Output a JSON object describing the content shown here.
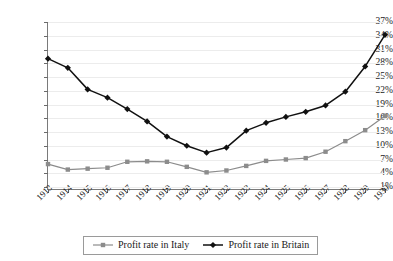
{
  "chart_data": {
    "type": "line",
    "title": "",
    "xlabel": "",
    "ylabel": "",
    "x": [
      1913,
      1914,
      1915,
      1916,
      1917,
      1918,
      1919,
      1920,
      1921,
      1922,
      1923,
      1924,
      1925,
      1926,
      1927,
      1928,
      1929,
      1930
    ],
    "categories": [
      "1913",
      "1914",
      "1915",
      "1916",
      "1917",
      "1918",
      "1919",
      "1920",
      "1921",
      "1922",
      "1923",
      "1924",
      "1925",
      "1926",
      "1927",
      "1928",
      "1929",
      "1930"
    ],
    "ylim": [
      1,
      37
    ],
    "yticks": [
      1,
      4,
      7,
      10,
      13,
      16,
      19,
      22,
      25,
      28,
      31,
      34,
      37
    ],
    "ytick_labels": [
      "1%",
      "4%",
      "7%",
      "10%",
      "13%",
      "16%",
      "19%",
      "22%",
      "25%",
      "28%",
      "31%",
      "34%",
      "37%"
    ],
    "grid": true,
    "legend_position": "bottom",
    "series": [
      {
        "name": "Profit rate in Italy",
        "color": "#8c8c8c",
        "marker": "square",
        "values": [
          6.0,
          4.8,
          5.0,
          5.2,
          6.5,
          6.6,
          6.5,
          5.4,
          4.2,
          4.6,
          5.6,
          6.7,
          7.0,
          7.3,
          8.7,
          11.0,
          13.4,
          16.5
        ]
      },
      {
        "name": "Profit rate in Britain",
        "color": "#111111",
        "marker": "diamond",
        "values": [
          29.0,
          27.0,
          22.3,
          20.5,
          18.0,
          15.3,
          12.0,
          10.0,
          8.5,
          9.6,
          13.3,
          15.0,
          16.3,
          17.4,
          18.8,
          21.8,
          27.3,
          34.2
        ]
      }
    ]
  },
  "legend": {
    "entries": [
      {
        "label": "Profit rate in Italy"
      },
      {
        "label": "Profit rate in Britain"
      }
    ]
  }
}
